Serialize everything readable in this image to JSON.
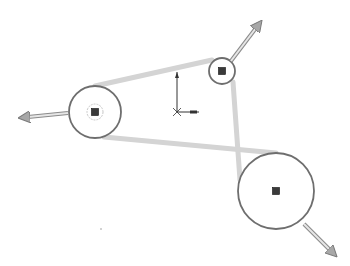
{
  "diagram": {
    "type": "cad-sketch-belt",
    "colors": {
      "background": "#ffffff",
      "circle_stroke": "#6e6e6e",
      "belt_line": "#d4d4d4",
      "center_point": "#3a3a3a",
      "arrow_fill": "#b8b8b8",
      "arrow_stroke": "#8a8a8a",
      "origin": "#333333"
    },
    "circles": [
      {
        "id": "left",
        "cx": 95,
        "cy": 112,
        "r": 26,
        "inner_r": 8
      },
      {
        "id": "top",
        "cx": 222,
        "cy": 71,
        "r": 13,
        "inner_r": 0
      },
      {
        "id": "bottom",
        "cx": 276,
        "cy": 191,
        "r": 38,
        "inner_r": 0
      }
    ],
    "belt_lines": [
      {
        "x1": 95,
        "y1": 86,
        "x2": 212,
        "y2": 60
      },
      {
        "x1": 104,
        "y1": 137,
        "x2": 276,
        "y2": 153
      },
      {
        "x1": 233,
        "y1": 82,
        "x2": 240,
        "y2": 180
      }
    ],
    "drag_arrows": [
      {
        "id": "arrow-left",
        "x1": 68,
        "y1": 113,
        "x2": 28,
        "y2": 117
      },
      {
        "id": "arrow-top",
        "x1": 231,
        "y1": 61,
        "x2": 256,
        "y2": 28
      },
      {
        "id": "arrow-bottom",
        "x1": 304,
        "y1": 224,
        "x2": 330,
        "y2": 250
      }
    ],
    "origin": {
      "x": 177,
      "y": 112,
      "y_len": 40,
      "x_len": 22
    },
    "stray_dot": {
      "x": 101,
      "y": 229
    }
  }
}
